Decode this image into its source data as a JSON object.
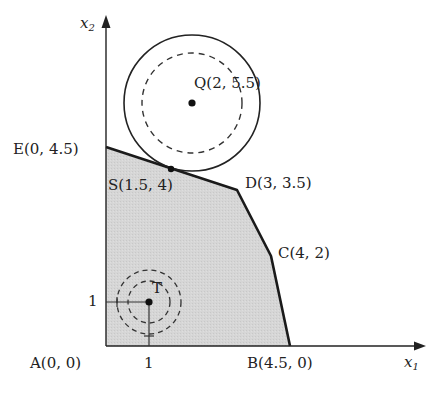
{
  "figure": {
    "type": "linear-programming feasible region",
    "axes": {
      "x_label": "x",
      "x_sub": "1",
      "y_label": "x",
      "y_sub": "2",
      "x_tick": "1",
      "y_tick": "1"
    },
    "vertices": [
      {
        "name": "A",
        "label": "A(0, 0)",
        "x": 0,
        "y": 0
      },
      {
        "name": "B",
        "label": "B(4.5, 0)",
        "x": 4.5,
        "y": 0
      },
      {
        "name": "C",
        "label": "C(4, 2)",
        "x": 4,
        "y": 2
      },
      {
        "name": "D",
        "label": "D(3, 3.5)",
        "x": 3,
        "y": 3.5
      },
      {
        "name": "E",
        "label": "E(0, 4.5)",
        "x": 0,
        "y": 4.5
      }
    ],
    "points": [
      {
        "name": "S",
        "label": "S(1.5, 4)",
        "x": 1.5,
        "y": 4
      },
      {
        "name": "Q",
        "label": "Q(2, 5.5)",
        "x": 2,
        "y": 5.5
      },
      {
        "name": "T",
        "label": "T",
        "x": 1,
        "y": 1
      }
    ],
    "colors": {
      "region_fill": "#d4d4d4",
      "stroke": "#1a1a1a"
    }
  }
}
